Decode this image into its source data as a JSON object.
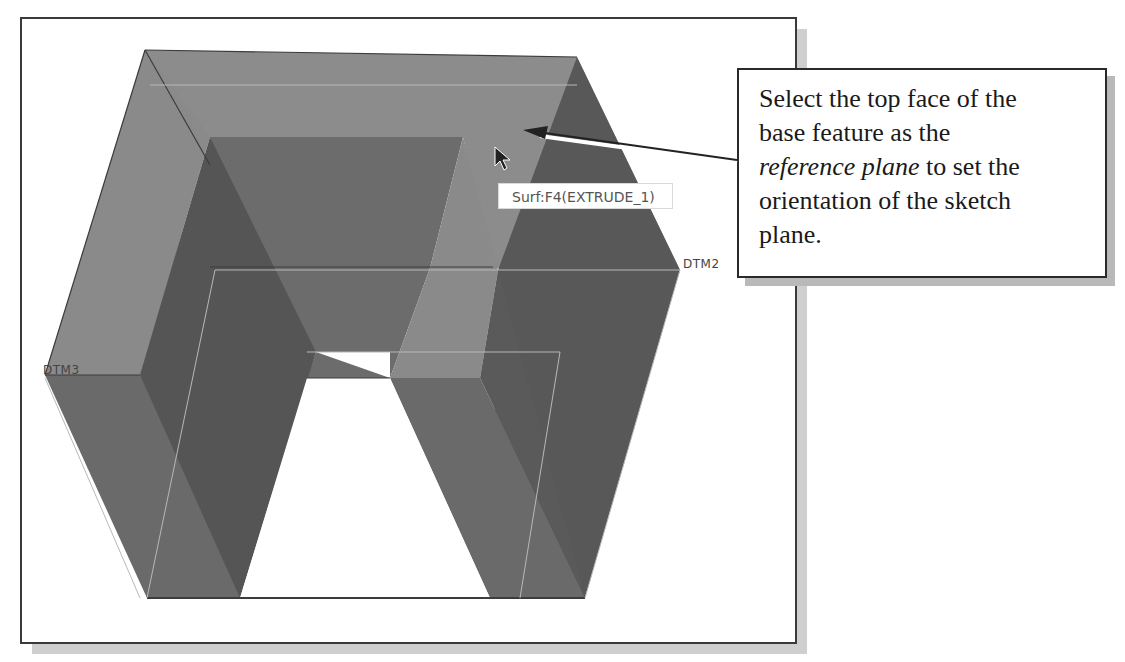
{
  "viewport": {
    "tooltip": "Surf:F4(EXTRUDE_1)",
    "datums": {
      "dtm3": "DTM3",
      "dtm2": "DTM2",
      "dtm1": "DTM1"
    },
    "colors": {
      "top_face": "#8c8c8c",
      "mid_face": "#6f6f6f",
      "dark_face": "#575757",
      "edge": "#3c3c3c",
      "datum_line": "#b4b4b4"
    }
  },
  "callout": {
    "line1": "Select the top face of the",
    "line2": "base feature as the",
    "line3_italic": "reference plane",
    "line3_rest": " to set the",
    "line4": "orientation of the sketch",
    "line5": "plane."
  }
}
